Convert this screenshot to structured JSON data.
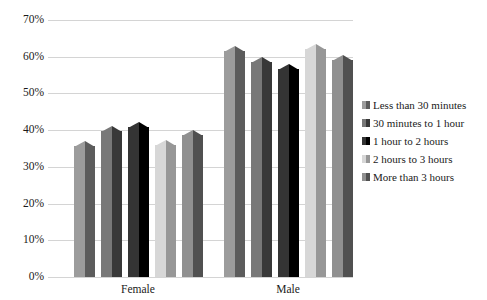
{
  "chart_data": {
    "type": "bar",
    "title": "",
    "subtitle": "",
    "xlabel": "",
    "ylabel": "",
    "categories": [
      "Female",
      "Male"
    ],
    "series": [
      {
        "name": "Less than 30 minutes",
        "values": [
          37.0,
          63.0
        ],
        "color": "#7a7a7a"
      },
      {
        "name": "30 minutes to 1 hour",
        "values": [
          41.0,
          60.0
        ],
        "color": "#565656"
      },
      {
        "name": "1 hour to 2 hours",
        "values": [
          42.3,
          58.0
        ],
        "color": "#121212"
      },
      {
        "name": "2 hours to 3 hours",
        "values": [
          37.2,
          63.5
        ],
        "color": "#b5b5b5"
      },
      {
        "name": "More than 3 hours",
        "values": [
          40.0,
          60.5
        ],
        "color": "#6e6e6e"
      }
    ],
    "ylim": [
      0,
      70
    ],
    "ytick_labels": [
      "70%",
      "60%",
      "50%",
      "40%",
      "30%",
      "20%",
      "10%",
      "0%"
    ],
    "ytick_values": [
      70,
      60,
      50,
      40,
      30,
      20,
      10,
      0
    ],
    "grid": true,
    "grid_color": "#d4d4d4",
    "legend_position": "right",
    "background": "#ffffff"
  }
}
